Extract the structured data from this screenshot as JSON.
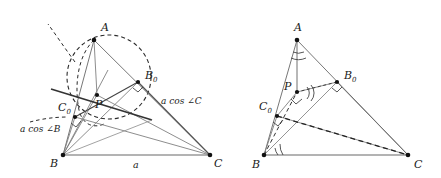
{
  "figure": {
    "background": "#ffffff",
    "ink": "#1a1a1a",
    "thin_stroke": "#555555",
    "width": 441,
    "height": 178
  },
  "left_diagram": {
    "name": "left-triangle-diagram",
    "vertices": {
      "A": {
        "label": "A",
        "x": 94,
        "y": 40,
        "label_x": 101,
        "label_y": 31
      },
      "B": {
        "label": "B",
        "x": 63,
        "y": 155,
        "label_x": 50,
        "label_y": 167
      },
      "C": {
        "label": "C",
        "x": 210,
        "y": 155,
        "label_x": 214,
        "label_y": 167
      },
      "P": {
        "label": "P",
        "x": 97,
        "y": 95,
        "label_x": 95,
        "label_y": 108
      },
      "B0": {
        "label": "B",
        "sub": "0",
        "x": 138,
        "y": 82,
        "label_x": 145,
        "label_y": 79
      },
      "C0": {
        "label": "C",
        "sub": "0",
        "x": 75,
        "y": 117,
        "label_x": 58,
        "label_y": 111
      }
    },
    "annotations": [
      {
        "name": "side-a-label",
        "text": "a",
        "x": 133,
        "y": 166
      },
      {
        "name": "a-cos-angle-C-label",
        "text": "a cos ∠C",
        "x": 161,
        "y": 101
      },
      {
        "name": "a-cos-angle-B-label",
        "text": "a cos ∠B",
        "x": 20,
        "y": 130
      }
    ],
    "features": {
      "dashed_circle": true,
      "right_angle_at_B0": true,
      "right_angle_at_C0": true,
      "thick_line_C0_P_B0": true
    }
  },
  "right_diagram": {
    "name": "right-triangle-diagram",
    "vertices": {
      "A": {
        "label": "A",
        "x": 297,
        "y": 40,
        "label_x": 294,
        "label_y": 30
      },
      "B": {
        "label": "B",
        "x": 264,
        "y": 155,
        "label_x": 252,
        "label_y": 168
      },
      "C": {
        "label": "C",
        "x": 408,
        "y": 155,
        "label_x": 414,
        "label_y": 168
      },
      "P": {
        "label": "P",
        "x": 297,
        "y": 92,
        "label_x": 286,
        "label_y": 90
      },
      "B0": {
        "label": "B",
        "sub": "0",
        "x": 337,
        "y": 82,
        "label_x": 344,
        "label_y": 79
      },
      "C0": {
        "label": "C",
        "sub": "0",
        "x": 277,
        "y": 116,
        "label_x": 259,
        "label_y": 110
      }
    },
    "features": {
      "double_arc_at_A": true,
      "double_arc_at_B": true,
      "double_arc_at_P": true,
      "right_angle_at_B0": true,
      "right_angle_at_C0": true,
      "right_angle_at_P": true,
      "dashed_C0_to_C": true,
      "dashed_B_to_B0": true
    }
  }
}
